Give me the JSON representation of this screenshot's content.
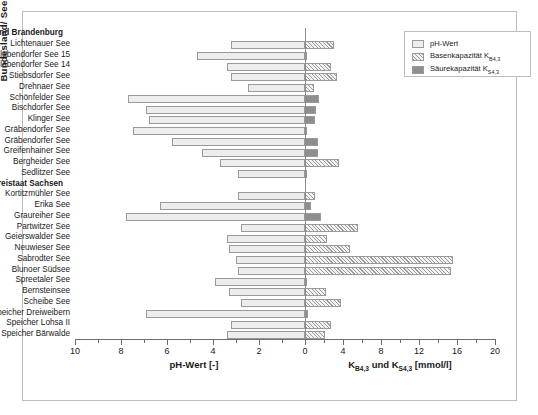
{
  "axes": {
    "y_title": "Bundesland/ Seename",
    "x_title_left": "pH-Wert [-]",
    "x_title_right_pre": "K",
    "x_title_right_sub1": "B4,3",
    "x_title_right_mid": " und K",
    "x_title_right_sub2": "S4,3",
    "x_title_right_post": " [mmol/l]",
    "left_ticks": [
      "10",
      "8",
      "6",
      "4",
      "2",
      "0"
    ],
    "right_ticks": [
      "0",
      "4",
      "8",
      "12",
      "16",
      "20"
    ]
  },
  "legend": {
    "items": [
      {
        "label": "pH-Wert",
        "sub": "",
        "swatch": "ph",
        "color": "#ededed"
      },
      {
        "label": "Basenkapazität K",
        "sub": "B4,3",
        "swatch": "base",
        "color": "#9b9b9b"
      },
      {
        "label": "Säurekapazität K",
        "sub": "S4,3",
        "swatch": "acid",
        "color": "#8e8e8e"
      }
    ]
  },
  "chart_data": {
    "type": "bar",
    "title": "",
    "orientation": "horizontal",
    "grid": false,
    "legend_position": "top-right",
    "xlabel_left": "pH-Wert [-]",
    "xlabel_right": "K_B4,3 und K_S4,3 [mmol/l]",
    "ylabel": "Bundesland/ Seename",
    "left_axis_range": [
      10,
      0
    ],
    "right_axis_range": [
      0,
      20
    ],
    "series": [
      {
        "name": "pH-Wert",
        "axis": "left",
        "unit": "-"
      },
      {
        "name": "Basenkapazität K_B4,3",
        "axis": "right",
        "unit": "mmol/l"
      },
      {
        "name": "Säurekapazität K_S4,3",
        "axis": "right",
        "unit": "mmol/l"
      }
    ],
    "groups": [
      {
        "name": "Land Brandenburg",
        "rows": [
          {
            "label": "Lichtenauer See",
            "ph": 3.2,
            "base": 3.0,
            "acid": 0
          },
          {
            "label": "Schlabendorfer See 15",
            "ph": 4.7,
            "base": 0.1,
            "acid": 0
          },
          {
            "label": "Schlabendorfer See 14",
            "ph": 3.4,
            "base": 2.7,
            "acid": 0
          },
          {
            "label": "Stiebsdorfer See",
            "ph": 3.2,
            "base": 3.4,
            "acid": 0
          },
          {
            "label": "Drehnaer See",
            "ph": 2.5,
            "base": 0.9,
            "acid": 0
          },
          {
            "label": "Schönfelder See",
            "ph": 7.7,
            "base": 0,
            "acid": 1.5
          },
          {
            "label": "Bischdorfer See",
            "ph": 6.9,
            "base": 0,
            "acid": 1.2
          },
          {
            "label": "Klinger See",
            "ph": 6.8,
            "base": 0,
            "acid": 1.1
          },
          {
            "label": "Gräbendorfer See",
            "ph": 7.5,
            "base": 0,
            "acid": 0.05
          },
          {
            "label": "Gräbendorfer See ",
            "ph": 5.8,
            "base": 0,
            "acid": 1.4
          },
          {
            "label": "Greifenhainer See",
            "ph": 4.5,
            "base": 0,
            "acid": 1.4
          },
          {
            "label": "Bergheider See",
            "ph": 3.7,
            "base": 3.6,
            "acid": 0
          },
          {
            "label": "Sedlitzer See",
            "ph": 2.9,
            "base": 0.2,
            "acid": 0
          }
        ]
      },
      {
        "name": "Freistaat Sachsen",
        "rows": [
          {
            "label": "Kortitzmühler See",
            "ph": 2.9,
            "base": 1.0,
            "acid": 0
          },
          {
            "label": "Erika See",
            "ph": 6.3,
            "base": 0,
            "acid": 0.6
          },
          {
            "label": "Graureiher See",
            "ph": 7.8,
            "base": 0,
            "acid": 1.7
          },
          {
            "label": "Partwitzer See",
            "ph": 2.8,
            "base": 5.6,
            "acid": 0
          },
          {
            "label": "Geierswalder See",
            "ph": 3.4,
            "base": 2.3,
            "acid": 0
          },
          {
            "label": "Neuwieser See",
            "ph": 3.3,
            "base": 4.7,
            "acid": 0
          },
          {
            "label": "Sabrodter See",
            "ph": 3.0,
            "base": 15.6,
            "acid": 0
          },
          {
            "label": "Blunoer Südsee",
            "ph": 2.9,
            "base": 15.4,
            "acid": 0
          },
          {
            "label": "Spreetaler See",
            "ph": 3.9,
            "base": 0.1,
            "acid": 0
          },
          {
            "label": "Bernsteinsee",
            "ph": 3.3,
            "base": 2.2,
            "acid": 0
          },
          {
            "label": "Scheibe See",
            "ph": 2.8,
            "base": 3.8,
            "acid": 0
          },
          {
            "label": "Speicher Dreiweibern",
            "ph": 6.9,
            "base": 0,
            "acid": 0.3
          },
          {
            "label": "Speicher Lohsa II",
            "ph": 3.2,
            "base": 2.7,
            "acid": 0
          },
          {
            "label": "Speicher Bärwalde",
            "ph": 3.4,
            "base": 2.1,
            "acid": 0
          }
        ]
      }
    ]
  }
}
